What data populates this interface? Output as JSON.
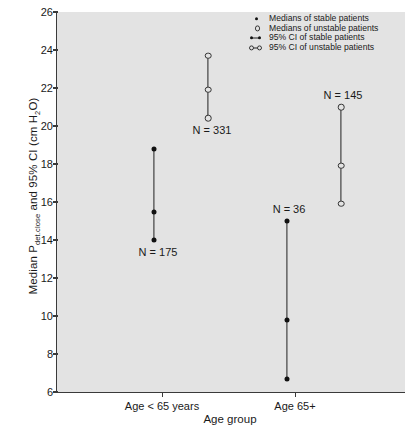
{
  "chart_data": {
    "type": "scatter",
    "title": "",
    "xlabel": "Age group",
    "ylabel": "Median Pdet.close and 95% CI (cm H2O)",
    "ylabel_main": "Median P",
    "ylabel_sub": "det.close",
    "ylabel_tail": " and 95% CI (cm H",
    "ylabel_sub2": "2",
    "ylabel_tail2": "O)",
    "categories": [
      "Age < 65 years",
      "Age 65+"
    ],
    "ylim": [
      6,
      26
    ],
    "yticks": [
      6,
      8,
      10,
      12,
      14,
      16,
      18,
      20,
      22,
      24,
      26
    ],
    "grid": false,
    "legend_position": "top-right",
    "series": [
      {
        "name": "Medians of stable patients",
        "marker": "filled-circle",
        "points": [
          {
            "category": "Age < 65 years",
            "median": 15.5,
            "ci_low": 14.0,
            "ci_high": 18.8,
            "n_label": "N = 175",
            "n": 175
          },
          {
            "category": "Age 65+",
            "median": 9.8,
            "ci_low": 6.7,
            "ci_high": 15.0,
            "n_label": "N = 36",
            "n": 36
          }
        ]
      },
      {
        "name": "Medians of unstable patients",
        "marker": "open-circle",
        "points": [
          {
            "category": "Age < 65 years",
            "median": 21.9,
            "ci_low": 20.4,
            "ci_high": 23.7,
            "n_label": "N = 331",
            "n": 331
          },
          {
            "category": "Age 65+",
            "median": 17.9,
            "ci_low": 15.9,
            "ci_high": 21.0,
            "n_label": "N = 145",
            "n": 145
          }
        ]
      }
    ],
    "legend": [
      {
        "key": "filled-dot",
        "label": "Medians of stable patients"
      },
      {
        "key": "open-dot",
        "label": "Medians of unstable patients"
      },
      {
        "key": "filled-ci",
        "label": "95% CI of stable patients"
      },
      {
        "key": "open-ci",
        "label": "95% CI of unstable patients"
      }
    ],
    "colors": {
      "plot_background": "#e3e3e3",
      "axis": "#3a3a3a",
      "marker_stable": "#111111",
      "marker_unstable": "#333333",
      "text": "#1a1a1a"
    }
  }
}
